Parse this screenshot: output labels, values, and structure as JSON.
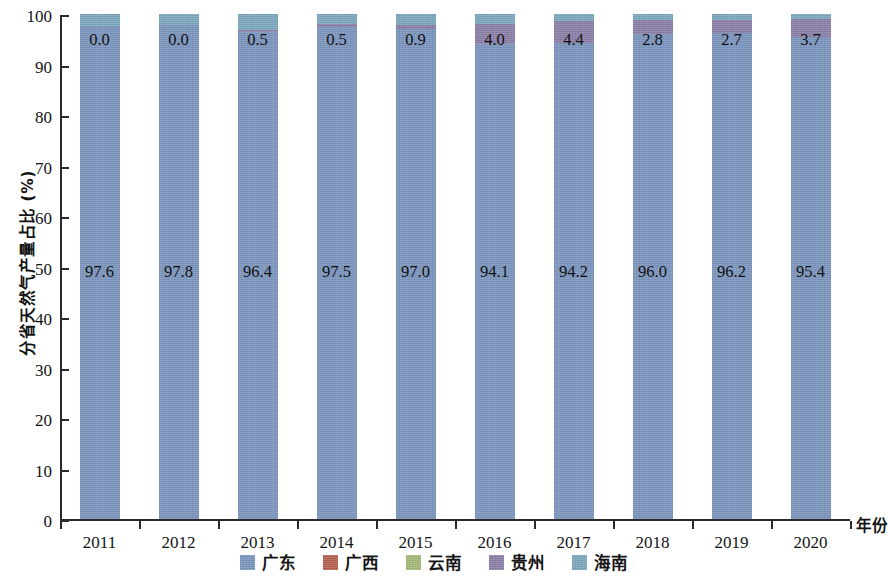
{
  "chart_data": {
    "type": "bar",
    "subtype": "stacked-bar-100",
    "title": "",
    "xlabel": "年份",
    "ylabel": "分省天然气产量占比 (%)",
    "categories": [
      "2011",
      "2012",
      "2013",
      "2014",
      "2015",
      "2016",
      "2017",
      "2018",
      "2019",
      "2020"
    ],
    "ylim": [
      0,
      100
    ],
    "yticks": [
      0,
      10,
      20,
      30,
      40,
      50,
      60,
      70,
      80,
      90,
      100
    ],
    "grid": false,
    "legend_position": "bottom",
    "series": [
      {
        "name": "广东",
        "color": "#7b95bd",
        "values": [
          97.6,
          97.8,
          96.4,
          97.5,
          97.0,
          94.1,
          94.2,
          96.0,
          96.2,
          95.4
        ],
        "labels": [
          "97.6",
          "97.8",
          "96.4",
          "97.5",
          "97.0",
          "94.1",
          "94.2",
          "96.0",
          "96.2",
          "95.4"
        ]
      },
      {
        "name": "广西",
        "color": "#b4604f",
        "values": [
          0.0,
          0.0,
          0.0,
          0.0,
          0.0,
          0.0,
          0.0,
          0.0,
          0.0,
          0.0
        ],
        "labels": [
          "",
          "",
          "",
          "",
          "",
          "",
          "",
          "",
          "",
          ""
        ]
      },
      {
        "name": "云南",
        "color": "#a3b778",
        "values": [
          0.0,
          0.0,
          0.0,
          0.0,
          0.0,
          0.0,
          0.0,
          0.0,
          0.0,
          0.0
        ],
        "labels": [
          "",
          "",
          "",
          "",
          "",
          "",
          "",
          "",
          "",
          ""
        ]
      },
      {
        "name": "贵州",
        "color": "#8b7fa8",
        "values": [
          0.0,
          0.0,
          0.5,
          0.5,
          0.9,
          4.0,
          4.4,
          2.8,
          2.7,
          3.7
        ],
        "labels": [
          "0.0",
          "0.0",
          "0.5",
          "0.5",
          "0.9",
          "4.0",
          "4.4",
          "2.8",
          "2.7",
          "3.7"
        ]
      },
      {
        "name": "海南",
        "color": "#7ba7bd",
        "values": [
          2.4,
          2.2,
          3.1,
          2.0,
          2.1,
          1.9,
          1.4,
          1.2,
          1.1,
          0.9
        ],
        "labels": [
          "",
          "",
          "",
          "",
          "",
          "",
          "",
          "",
          "",
          ""
        ]
      }
    ],
    "top_labels": [
      "0.0",
      "0.0",
      "0.5",
      "0.5",
      "0.9",
      "4.0",
      "4.4",
      "2.8",
      "2.7",
      "3.7"
    ],
    "main_labels": [
      "97.6",
      "97.8",
      "96.4",
      "97.5",
      "97.0",
      "94.1",
      "94.2",
      "96.0",
      "96.2",
      "95.4"
    ]
  },
  "legend": {
    "items": [
      {
        "label": "广东",
        "color": "#7b95bd"
      },
      {
        "label": "广西",
        "color": "#b4604f"
      },
      {
        "label": "云南",
        "color": "#a3b778"
      },
      {
        "label": "贵州",
        "color": "#8b7fa8"
      },
      {
        "label": "海南",
        "color": "#7ba7bd"
      }
    ]
  },
  "axes": {
    "y_title": "分省天然气产量占比 (%)",
    "x_title": "年份",
    "y_tick_labels": [
      "100",
      "90",
      "80",
      "70",
      "60",
      "50",
      "40",
      "30",
      "20",
      "10",
      "0"
    ],
    "x_tick_labels": [
      "2011",
      "2012",
      "2013",
      "2014",
      "2015",
      "2016",
      "2017",
      "2018",
      "2019",
      "2020"
    ]
  }
}
